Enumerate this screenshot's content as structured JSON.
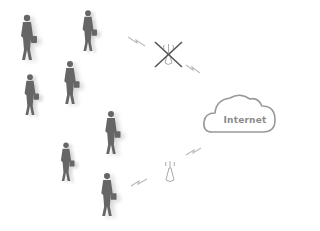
{
  "diagram": {
    "cloud_label": "Internet",
    "colors": {
      "person": "#666666",
      "shadow": "#d8d8d8",
      "stroke": "#999999",
      "cross": "#555555",
      "bolt": "#bbbbbb"
    },
    "nodes": [
      {
        "id": "crowd",
        "type": "people-group",
        "count": 8
      },
      {
        "id": "ap-disabled",
        "type": "wifi-access-point",
        "state": "crossed-out"
      },
      {
        "id": "ap-active",
        "type": "wifi-access-point",
        "state": "active"
      },
      {
        "id": "internet",
        "type": "cloud",
        "label": "Internet"
      }
    ],
    "edges": [
      {
        "from": "crowd",
        "to": "ap-disabled",
        "style": "lightning"
      },
      {
        "from": "ap-disabled",
        "to": "internet",
        "style": "lightning"
      },
      {
        "from": "crowd",
        "to": "ap-active",
        "style": "lightning"
      },
      {
        "from": "ap-active",
        "to": "internet",
        "style": "lightning"
      }
    ]
  }
}
